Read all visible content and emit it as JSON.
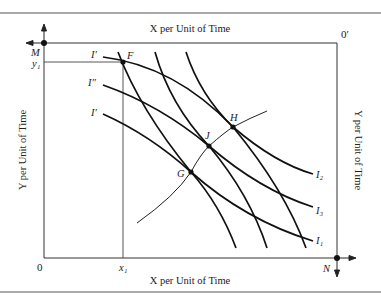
{
  "diagram": {
    "type": "edgeworth-box",
    "top_axis_label": "X per Unit of Time",
    "bottom_axis_label": "X per Unit of Time",
    "left_axis_label": "Y per Unit of Time",
    "right_axis_label": "Y per Unit of Time",
    "origin_bottom_left": "0",
    "origin_top_right": "0′",
    "corner_top_left": "M",
    "corner_bottom_right": "N",
    "x_tick": "x₁",
    "y_tick": "y₁",
    "points": {
      "F": "F",
      "G": "G",
      "J": "J",
      "H": "H"
    },
    "left_curve_labels": [
      "I′",
      "I″",
      "I′"
    ],
    "right_curve_labels": [
      "I₂",
      "I₃",
      "I₁"
    ],
    "colors": {
      "line": "#1a1a1a",
      "background": "#ffffff"
    }
  }
}
